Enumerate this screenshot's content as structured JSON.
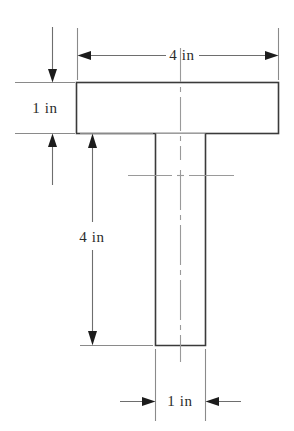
{
  "figure": {
    "units": "in",
    "background_color": "#ffffff",
    "outline_color": "#3a3a3a",
    "dimension_line_color": "#6e6e6e",
    "extension_line_color": "#8a8a8a",
    "center_line_color": "#9a9a9a",
    "text_color": "#2b2b2b"
  },
  "shape": {
    "name": "tee-section",
    "flange": {
      "label": "flange",
      "width_value": 4,
      "height_value": 1,
      "width_text": "4 in",
      "height_text": "1 in"
    },
    "web": {
      "label": "web",
      "width_value": 1,
      "height_value": 4,
      "width_text": "1 in",
      "height_text": "4 in"
    }
  },
  "dimensions": [
    {
      "id": "flange-width",
      "name": "flange-width-dimension",
      "text": "4 in",
      "orientation": "horizontal",
      "position": "top",
      "arrow_direction": "outward",
      "value": 4,
      "unit": "in"
    },
    {
      "id": "flange-thickness",
      "name": "flange-thickness-dimension",
      "text": "1 in",
      "orientation": "vertical",
      "position": "left-upper",
      "arrow_direction": "outward",
      "value": 1,
      "unit": "in"
    },
    {
      "id": "web-height",
      "name": "web-height-dimension",
      "text": "4 in",
      "orientation": "vertical",
      "position": "left-lower",
      "arrow_direction": "inward",
      "value": 4,
      "unit": "in"
    },
    {
      "id": "web-width",
      "name": "web-width-dimension",
      "text": "1 in",
      "orientation": "horizontal",
      "position": "bottom",
      "arrow_direction": "inward",
      "value": 1,
      "unit": "in"
    }
  ],
  "labels": {
    "top_width": "4 in",
    "left_thickness": "1 in",
    "left_height": "4 in",
    "bottom_width": "1 in"
  }
}
